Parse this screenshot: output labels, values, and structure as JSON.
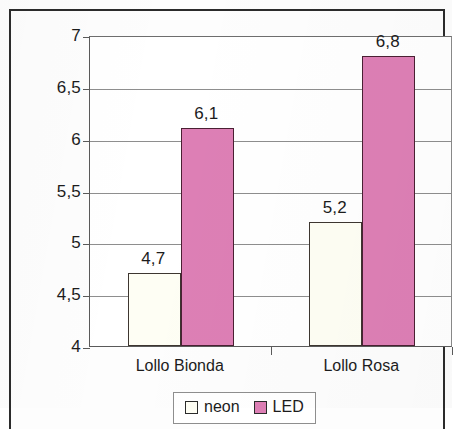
{
  "chart_data": {
    "type": "bar",
    "title": "",
    "subtitle": "",
    "xlabel": "",
    "ylabel": "",
    "categories": [
      "Lollo Bionda",
      "Lollo Rosa"
    ],
    "series": [
      {
        "name": "neon",
        "color": "#FEFEF4",
        "values": [
          4.7,
          5.2
        ],
        "labels": [
          "4,7",
          "5,2"
        ]
      },
      {
        "name": "LED",
        "color": "#DD7FB5",
        "values": [
          6.1,
          6.8
        ],
        "labels": [
          "6,1",
          "6,8"
        ]
      }
    ],
    "ylim": [
      4,
      7
    ],
    "ytick_values": [
      7,
      6.5,
      6,
      5.5,
      5,
      4.5,
      4
    ],
    "ytick_labels": [
      "7",
      "6,5",
      "6",
      "5,5",
      "5",
      "4,5",
      "4"
    ],
    "decimal_separator": ",",
    "grid": true,
    "grid_axis": "y",
    "legend_position": "bottom-center",
    "legend_entries": [
      "neon",
      "LED"
    ],
    "bar_border_color": "#3D3630",
    "plot_background": "#FFFFFF",
    "frame_color": "#2B2B2B"
  }
}
